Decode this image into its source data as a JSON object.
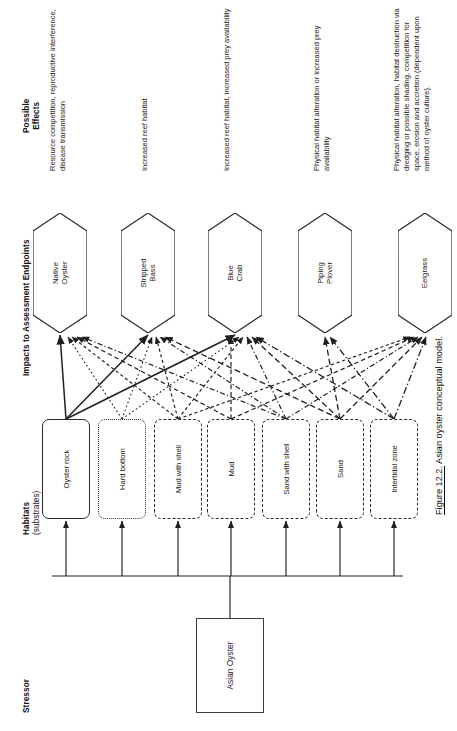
{
  "figure": {
    "caption_number": "Figure 12.2.",
    "caption_text": "Asian oyster conceptual model."
  },
  "bands": {
    "stressor": {
      "title": "Stressor"
    },
    "habitats": {
      "title": "Habitats",
      "subtitle": "(substrates)"
    },
    "endpoints": {
      "title": "Impacts to Assessment Endpoints"
    },
    "effects": {
      "title": "Possible",
      "title2": "Effects"
    }
  },
  "stressor": {
    "label": "Asian Oyster"
  },
  "habitats": [
    {
      "label": "Oyster rock",
      "style": "solid"
    },
    {
      "label": "Hard bottom",
      "style": "dotted"
    },
    {
      "label": "Mud with shell",
      "style": "dashed-fine"
    },
    {
      "label": "Mud",
      "style": "dashed"
    },
    {
      "label": "Sand with shell",
      "style": "dash-dot"
    },
    {
      "label": "Sand",
      "style": "dashed-long"
    },
    {
      "label": "Intertidal zone",
      "style": "dash-dot-long"
    }
  ],
  "endpoints": [
    {
      "line1": "Native",
      "line2": "Oyster"
    },
    {
      "line1": "Stripped",
      "line2": "Bass"
    },
    {
      "line1": "Blue",
      "line2": "Crab"
    },
    {
      "line1": "Piping",
      "line2": "Plover"
    },
    {
      "line1": "Eelgrass",
      "line2": ""
    }
  ],
  "effects": [
    {
      "text": "Resource competition, reproductive interference, disease transmission"
    },
    {
      "text": "Increased reef habitat"
    },
    {
      "text": "Increased reef habitat, increased prey availability"
    },
    {
      "text": "Physical habitat alteration or increased prey availability"
    },
    {
      "text": "Physical habitat alteration, habitat destruction via dredging or possible shading, competition for space, erosion and accretion (dependent upon method of oyster culture)."
    }
  ],
  "colors": {
    "ink": "#222222",
    "line": "#2b2b2b",
    "background": "#ffffff"
  }
}
